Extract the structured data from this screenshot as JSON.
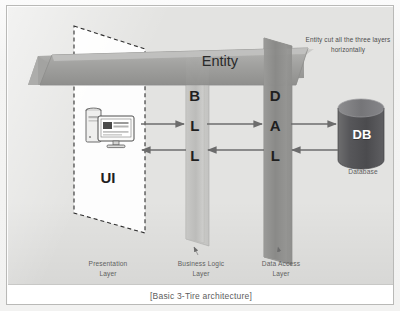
{
  "figure": {
    "caption": "[Basic 3-Tire architecture]",
    "title": "Basic 3-Tire architecture"
  },
  "diagram": {
    "entity_banner": {
      "label": "Entity",
      "note": "Entity cut all the three layers horizontally",
      "color": "#9a9a98"
    },
    "presentation": {
      "box_label": "UI",
      "layer_label_line1": "Presentation",
      "layer_label_line2": "Layer",
      "icon": "desktop-computer-icon",
      "border_style": "dashed"
    },
    "business": {
      "letters": [
        "B",
        "L",
        "L"
      ],
      "layer_label_line1": "Business Logic",
      "layer_label_line2": "Layer",
      "color": "#c2c2c0"
    },
    "data_access": {
      "letters": [
        "D",
        "A",
        "L"
      ],
      "layer_label_line1": "Data Access",
      "layer_label_line2": "Layer",
      "color": "#8e8e8c"
    },
    "database": {
      "label": "DB",
      "caption": "Database",
      "icon": "database-cylinder-icon",
      "color": "#59595a"
    },
    "connectors": [
      {
        "name": "ui-to-bll",
        "direction": "right"
      },
      {
        "name": "bll-to-ui",
        "direction": "left"
      },
      {
        "name": "bll-to-dal",
        "direction": "right"
      },
      {
        "name": "dal-to-bll",
        "direction": "left"
      },
      {
        "name": "dal-to-db",
        "direction": "right"
      },
      {
        "name": "db-to-dal",
        "direction": "left"
      }
    ]
  }
}
